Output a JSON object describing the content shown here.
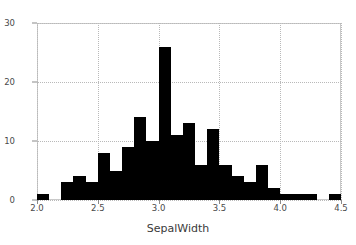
{
  "chart_data": {
    "type": "bar",
    "title": "",
    "subtitle": "",
    "xlabel": "SepalWidth",
    "ylabel": "",
    "xlim": [
      2.0,
      4.5
    ],
    "ylim": [
      0,
      30
    ],
    "grid": true,
    "legend": null,
    "bin_width": 0.1,
    "bar_color": "#000000",
    "grid_color": "#b9b9b9",
    "frame_color": "#c9c9c9",
    "xticks": [
      {
        "value": 2.0,
        "label": "2.0"
      },
      {
        "value": 2.5,
        "label": "2.5"
      },
      {
        "value": 3.0,
        "label": "3.0"
      },
      {
        "value": 3.5,
        "label": "3.5"
      },
      {
        "value": 4.0,
        "label": "4.0"
      },
      {
        "value": 4.5,
        "label": "4.5"
      }
    ],
    "yticks": [
      {
        "value": 0,
        "label": "0"
      },
      {
        "value": 10,
        "label": "10"
      },
      {
        "value": 20,
        "label": "20"
      },
      {
        "value": 30,
        "label": "30"
      }
    ],
    "bins": [
      {
        "left": 2.0,
        "right": 2.1,
        "count": 1
      },
      {
        "left": 2.1,
        "right": 2.2,
        "count": 0
      },
      {
        "left": 2.2,
        "right": 2.3,
        "count": 3
      },
      {
        "left": 2.3,
        "right": 2.4,
        "count": 4
      },
      {
        "left": 2.4,
        "right": 2.5,
        "count": 3
      },
      {
        "left": 2.5,
        "right": 2.6,
        "count": 8
      },
      {
        "left": 2.6,
        "right": 2.7,
        "count": 5
      },
      {
        "left": 2.7,
        "right": 2.8,
        "count": 9
      },
      {
        "left": 2.8,
        "right": 2.9,
        "count": 14
      },
      {
        "left": 2.9,
        "right": 3.0,
        "count": 10
      },
      {
        "left": 3.0,
        "right": 3.1,
        "count": 26
      },
      {
        "left": 3.1,
        "right": 3.2,
        "count": 11
      },
      {
        "left": 3.2,
        "right": 3.3,
        "count": 13
      },
      {
        "left": 3.3,
        "right": 3.4,
        "count": 6
      },
      {
        "left": 3.4,
        "right": 3.5,
        "count": 12
      },
      {
        "left": 3.5,
        "right": 3.6,
        "count": 6
      },
      {
        "left": 3.6,
        "right": 3.7,
        "count": 4
      },
      {
        "left": 3.7,
        "right": 3.8,
        "count": 3
      },
      {
        "left": 3.8,
        "right": 3.9,
        "count": 6
      },
      {
        "left": 3.9,
        "right": 4.0,
        "count": 2
      },
      {
        "left": 4.0,
        "right": 4.1,
        "count": 1
      },
      {
        "left": 4.1,
        "right": 4.2,
        "count": 1
      },
      {
        "left": 4.2,
        "right": 4.3,
        "count": 1
      },
      {
        "left": 4.3,
        "right": 4.4,
        "count": 0
      },
      {
        "left": 4.4,
        "right": 4.5,
        "count": 1
      }
    ],
    "categories": [
      "2.0",
      "2.1",
      "2.2",
      "2.3",
      "2.4",
      "2.5",
      "2.6",
      "2.7",
      "2.8",
      "2.9",
      "3.0",
      "3.1",
      "3.2",
      "3.3",
      "3.4",
      "3.5",
      "3.6",
      "3.7",
      "3.8",
      "3.9",
      "4.0",
      "4.1",
      "4.2",
      "4.3",
      "4.4"
    ],
    "values": [
      1,
      0,
      3,
      4,
      3,
      8,
      5,
      9,
      14,
      10,
      26,
      11,
      13,
      6,
      12,
      6,
      4,
      3,
      6,
      2,
      1,
      1,
      1,
      0,
      1
    ]
  }
}
